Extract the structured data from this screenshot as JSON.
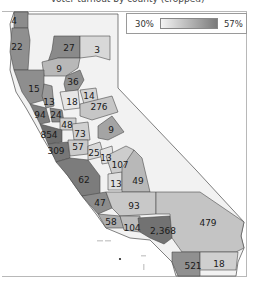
{
  "title": "Voter turnout by county (cropped)",
  "legend": {
    "min_label": "30%",
    "max_label": "57%",
    "color_low": "#f4f4f4",
    "color_high": "#7a7a7a"
  },
  "counties": [
    {
      "id": "del-norte",
      "label": "4",
      "x": 14,
      "y": 21,
      "fill": "#8c8c8c"
    },
    {
      "id": "humboldt",
      "label": "22",
      "x": 17,
      "y": 47,
      "fill": "#8f8f8f"
    },
    {
      "id": "siskiyou",
      "label": "27",
      "x": 69,
      "y": 48,
      "fill": "#8a8a8a"
    },
    {
      "id": "modoc",
      "label": "3",
      "x": 97,
      "y": 50,
      "fill": "#d8d8d8"
    },
    {
      "id": "shasta",
      "label": "9",
      "x": 59,
      "y": 69,
      "fill": "#b8b8b8"
    },
    {
      "id": "mendocino",
      "label": "15",
      "x": 34,
      "y": 89,
      "fill": "#8e8e8e"
    },
    {
      "id": "butte",
      "label": "36",
      "x": 73,
      "y": 82,
      "fill": "#909090"
    },
    {
      "id": "lake",
      "label": "13",
      "x": 49,
      "y": 102,
      "fill": "#9a9a9a"
    },
    {
      "id": "sutter",
      "label": "18",
      "x": 72,
      "y": 102,
      "fill": "#e6e6e6"
    },
    {
      "id": "placer",
      "label": "14",
      "x": 89,
      "y": 96,
      "fill": "#d4d4d4"
    },
    {
      "id": "sacramento",
      "label": "276",
      "x": 99,
      "y": 107,
      "fill": "#c6c6c6"
    },
    {
      "id": "sonoma",
      "label": "94",
      "x": 40,
      "y": 115,
      "fill": "#7e7e7e"
    },
    {
      "id": "napa",
      "label": "24",
      "x": 56,
      "y": 115,
      "fill": "#8a8a8a"
    },
    {
      "id": "solano",
      "label": "48",
      "x": 67,
      "y": 125,
      "fill": "#cfcfcf"
    },
    {
      "id": "marin",
      "label": "854",
      "x": 49,
      "y": 135,
      "fill": "#6e6e6e"
    },
    {
      "id": "contra-costa",
      "label": "73",
      "x": 80,
      "y": 134,
      "fill": "#d0d0d0"
    },
    {
      "id": "san-mateo",
      "label": "309",
      "x": 56,
      "y": 151,
      "fill": "#777777"
    },
    {
      "id": "alameda",
      "label": "57",
      "x": 78,
      "y": 147,
      "fill": "#cacaca"
    },
    {
      "id": "tuolumne",
      "label": "9",
      "x": 111,
      "y": 130,
      "fill": "#a4a4a4"
    },
    {
      "id": "stanislaus",
      "label": "25",
      "x": 94,
      "y": 153,
      "fill": "#d8d8d8"
    },
    {
      "id": "merced",
      "label": "13",
      "x": 106,
      "y": 158,
      "fill": "#e2e2e2"
    },
    {
      "id": "fresno",
      "label": "107",
      "x": 120,
      "y": 165,
      "fill": "#cdcdcd"
    },
    {
      "id": "monterey",
      "label": "62",
      "x": 84,
      "y": 180,
      "fill": "#7c7c7c"
    },
    {
      "id": "kings",
      "label": "13",
      "x": 116,
      "y": 184,
      "fill": "#e0e0e0"
    },
    {
      "id": "tulare",
      "label": "49",
      "x": 138,
      "y": 181,
      "fill": "#b8b8b8"
    },
    {
      "id": "slo",
      "label": "47",
      "x": 100,
      "y": 203,
      "fill": "#8c8c8c"
    },
    {
      "id": "kern",
      "label": "93",
      "x": 134,
      "y": 206,
      "fill": "#c8c8c8"
    },
    {
      "id": "santa-barbara",
      "label": "58",
      "x": 111,
      "y": 222,
      "fill": "#acacac"
    },
    {
      "id": "ventura",
      "label": "104",
      "x": 132,
      "y": 228,
      "fill": "#bcbcbc"
    },
    {
      "id": "los-angeles",
      "label": "2,368",
      "x": 163,
      "y": 231,
      "fill": "#727272"
    },
    {
      "id": "san-bernardino",
      "label": "479",
      "x": 208,
      "y": 223,
      "fill": "#c4c4c4"
    },
    {
      "id": "san-diego",
      "label": "521",
      "x": 193,
      "y": 266,
      "fill": "#909090"
    },
    {
      "id": "imperial",
      "label": "18",
      "x": 219,
      "y": 264,
      "fill": "#cfcfcf"
    }
  ]
}
